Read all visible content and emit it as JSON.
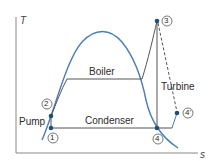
{
  "diagram": {
    "type": "T-s diagram (Rankine cycle)",
    "axes": {
      "y_label": "T",
      "x_label": "s"
    },
    "labels": {
      "boiler": "Boiler",
      "condenser": "Condenser",
      "turbine": "Turbine",
      "pump": "Pump"
    },
    "points": {
      "p1": "1",
      "p2": "2",
      "p3": "3",
      "p4": "4",
      "p4prime": "4'"
    },
    "colors": {
      "dome": "#4a7db8",
      "lines": "#555555",
      "points": "#1f4e79",
      "axes": "#777777"
    }
  }
}
